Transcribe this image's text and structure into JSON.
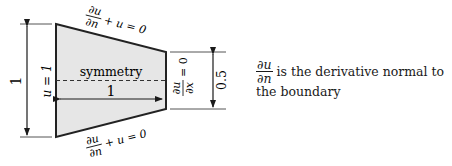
{
  "diagram": {
    "shape": "trapezoid",
    "fill_color": "#e6e6e6",
    "stroke_color": "#222222",
    "top_boundary_label": {
      "num": "∂u",
      "den": "∂n",
      "rest": "+ u = 0"
    },
    "bottom_boundary_label": {
      "num": "∂u",
      "den": "∂n",
      "rest": "+ u = 0"
    },
    "left_boundary_label": "u = 1",
    "right_boundary_label": {
      "num": "∂u",
      "den": "∂x",
      "rest": "= 0"
    },
    "symmetry_label": "symmetry",
    "length_label": "1",
    "left_height_label": "1",
    "right_height_label": "0.5"
  },
  "note": {
    "frac_num": "∂u",
    "frac_den": "∂n",
    "line1": "is the derivative normal to",
    "line2": "the boundary"
  }
}
